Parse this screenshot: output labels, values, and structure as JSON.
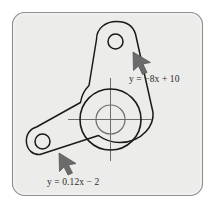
{
  "figure": {
    "type": "engineering-drawing",
    "panel": {
      "background_color": "#ececea",
      "border_color": "#8a8a8a",
      "outer_background_color": "#ffffff",
      "corner_radius": 12
    },
    "drawing": {
      "outline_color": "#1a1a1a",
      "centerline_color": "#6e6e6e",
      "bore_color": "#1a1a1a"
    },
    "annotations": [
      {
        "name": "upper-right-edge-callout",
        "equation": "y = −8x + 10",
        "parts": {
          "variable_y": "y",
          "equals": "=",
          "expression": "−8x + 10",
          "slope": "-8",
          "intercept": "10"
        },
        "arrow": {
          "name": "arrow-upper",
          "direction": "up-left",
          "color": "#6b6b6b",
          "points_at": "right edge of upper bracket arm"
        }
      },
      {
        "name": "lower-left-edge-callout",
        "equation": "y = 0.12x − 2",
        "parts": {
          "variable_y": "y",
          "equals": "=",
          "expression": "0.12x − 2",
          "slope": "0.12",
          "intercept": "-2"
        },
        "arrow": {
          "name": "arrow-lower",
          "direction": "up-left",
          "color": "#6b6b6b",
          "points_at": "lower edge of bracket base"
        }
      }
    ],
    "features": {
      "center_bore_label": "central bore",
      "upper_hole_label": "upper bolt hole",
      "lower_hole_label": "lower bolt hole",
      "crosshair_label": "center crosshair"
    }
  }
}
